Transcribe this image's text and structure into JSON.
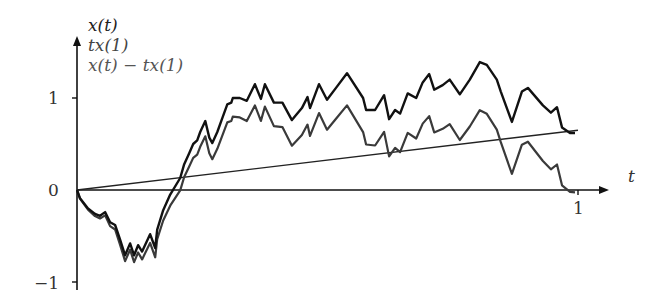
{
  "chart_data": {
    "type": "line",
    "title": "",
    "xlabel": "t",
    "ylabel": "",
    "xlim": [
      0,
      1.05
    ],
    "ylim": [
      -1,
      1.35
    ],
    "x_ticks": [
      "1"
    ],
    "y_ticks": [
      "1",
      "0",
      "−1"
    ],
    "grid": false,
    "legend_position": "top-left",
    "legend": [
      "x(t)",
      "tx(1)",
      "x(t) − tx(1)"
    ],
    "x1_value": 0.65,
    "series": [
      {
        "name": "x(t)",
        "color": "#111111",
        "points_t": [
          0,
          0.006,
          0.022,
          0.036,
          0.046,
          0.056,
          0.066,
          0.076,
          0.086,
          0.096,
          0.106,
          0.114,
          0.122,
          0.13,
          0.146,
          0.156,
          0.16,
          0.172,
          0.186,
          0.206,
          0.214,
          0.224,
          0.232,
          0.24,
          0.246,
          0.256,
          0.264,
          0.27,
          0.28,
          0.29,
          0.3,
          0.308,
          0.311,
          0.325,
          0.339,
          0.355,
          0.367,
          0.375,
          0.393,
          0.41,
          0.429,
          0.449,
          0.46,
          0.465,
          0.483,
          0.499,
          0.517,
          0.539,
          0.571,
          0.577,
          0.595,
          0.613,
          0.623,
          0.635,
          0.645,
          0.66,
          0.677,
          0.69,
          0.703,
          0.713,
          0.73,
          0.73,
          0.744,
          0.764,
          0.784,
          0.804,
          0.818,
          0.838,
          0.846,
          0.868,
          0.888,
          0.9,
          0.93,
          0.946,
          0.958,
          0.968,
          0.984,
          0.994
        ],
        "points_y": [
          0,
          -0.09,
          -0.2,
          -0.26,
          -0.28,
          -0.24,
          -0.35,
          -0.38,
          -0.54,
          -0.71,
          -0.58,
          -0.71,
          -0.6,
          -0.67,
          -0.48,
          -0.63,
          -0.43,
          -0.22,
          -0.05,
          0.13,
          0.28,
          0.4,
          0.5,
          0.54,
          0.63,
          0.75,
          0.57,
          0.51,
          0.63,
          0.78,
          0.93,
          0.95,
          1.0,
          1.0,
          0.97,
          1.15,
          0.99,
          1.15,
          0.95,
          0.95,
          0.76,
          0.89,
          1.01,
          0.89,
          1.15,
          0.98,
          1.11,
          1.27,
          1.0,
          0.87,
          0.87,
          1.03,
          0.77,
          0.87,
          0.83,
          1.05,
          1.0,
          1.17,
          1.26,
          1.09,
          1.14,
          1.14,
          1.2,
          1.04,
          1.2,
          1.39,
          1.36,
          1.2,
          1.07,
          0.74,
          1.07,
          1.11,
          0.92,
          0.84,
          0.9,
          0.68,
          0.62,
          0.62
        ]
      },
      {
        "name": "tx(1)",
        "color": "#222222",
        "points_t": [
          0,
          1
        ],
        "points_y": [
          0,
          0.65
        ]
      },
      {
        "name": "x(t) − tx(1)",
        "color": "#3a3a3a",
        "description": "same path as x(t) minus the line tx(1); ends at 0 at t=1"
      }
    ]
  },
  "axes": {
    "y_tick_1": "1",
    "y_tick_0": "0",
    "y_tick_neg1": "−1",
    "x_tick_1": "1",
    "x_label": "t"
  },
  "legend": {
    "line1": "x(t)",
    "line2": "tx(1)",
    "line3": "x(t) − tx(1)"
  }
}
